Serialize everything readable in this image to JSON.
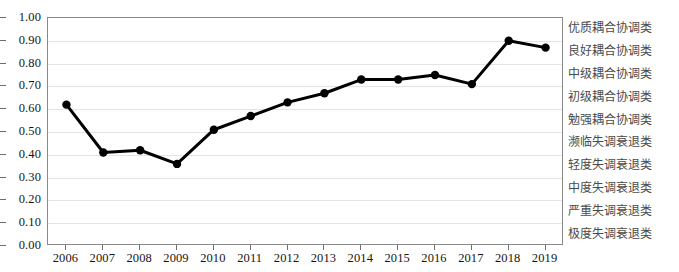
{
  "chart_data": {
    "type": "line",
    "title": "",
    "xlabel": "",
    "ylabel": "",
    "categories": [
      "2006",
      "2007",
      "2008",
      "2009",
      "2010",
      "2011",
      "2012",
      "2013",
      "2014",
      "2015",
      "2016",
      "2017",
      "2018",
      "2019"
    ],
    "values": [
      0.62,
      0.41,
      0.42,
      0.36,
      0.51,
      0.57,
      0.63,
      0.67,
      0.73,
      0.73,
      0.75,
      0.71,
      0.9,
      0.87
    ],
    "series": [
      {
        "name": "",
        "values": [
          0.62,
          0.41,
          0.42,
          0.36,
          0.51,
          0.57,
          0.63,
          0.67,
          0.73,
          0.73,
          0.75,
          0.71,
          0.9,
          0.87
        ]
      }
    ],
    "ylim": [
      0.0,
      1.0
    ],
    "ytick_values": [
      0.0,
      0.1,
      0.2,
      0.3,
      0.4,
      0.5,
      0.6,
      0.7,
      0.8,
      0.9,
      1.0
    ],
    "ytick_labels": [
      "0.00",
      "0.10",
      "0.20",
      "0.30",
      "0.40",
      "0.50",
      "0.60",
      "0.70",
      "0.80",
      "0.90",
      "1.00"
    ],
    "grid": true,
    "legend_position": "none",
    "marker": "circle",
    "line_color": "#000000",
    "marker_color": "#000000",
    "grid_color": "#e4e4e4",
    "axis_color": "#8a8a8a"
  },
  "y_axis": {
    "ticks": [
      {
        "label": "1.00",
        "value": 1.0
      },
      {
        "label": "0.90",
        "value": 0.9
      },
      {
        "label": "0.80",
        "value": 0.8
      },
      {
        "label": "0.70",
        "value": 0.7
      },
      {
        "label": "0.60",
        "value": 0.6
      },
      {
        "label": "0.50",
        "value": 0.5
      },
      {
        "label": "0.40",
        "value": 0.4
      },
      {
        "label": "0.30",
        "value": 0.3
      },
      {
        "label": "0.20",
        "value": 0.2
      },
      {
        "label": "0.10",
        "value": 0.1
      },
      {
        "label": "0.00",
        "value": 0.0
      }
    ]
  },
  "x_axis": {
    "ticks": [
      {
        "label": "2006"
      },
      {
        "label": "2007"
      },
      {
        "label": "2008"
      },
      {
        "label": "2009"
      },
      {
        "label": "2010"
      },
      {
        "label": "2011"
      },
      {
        "label": "2012"
      },
      {
        "label": "2013"
      },
      {
        "label": "2014"
      },
      {
        "label": "2015"
      },
      {
        "label": "2016"
      },
      {
        "label": "2017"
      },
      {
        "label": "2018"
      },
      {
        "label": "2019"
      }
    ]
  },
  "category_bands": {
    "items": [
      {
        "label": "优质耦合协调类",
        "upper": 1.0,
        "lower": 0.9
      },
      {
        "label": "良好耦合协调类",
        "upper": 0.9,
        "lower": 0.8
      },
      {
        "label": "中级耦合协调类",
        "upper": 0.8,
        "lower": 0.7
      },
      {
        "label": "初级耦合协调类",
        "upper": 0.7,
        "lower": 0.6
      },
      {
        "label": "勉强耦合协调类",
        "upper": 0.6,
        "lower": 0.5
      },
      {
        "label": "濒临失调衰退类",
        "upper": 0.5,
        "lower": 0.4
      },
      {
        "label": "轻度失调衰退类",
        "upper": 0.4,
        "lower": 0.3
      },
      {
        "label": "中度失调衰退类",
        "upper": 0.3,
        "lower": 0.2
      },
      {
        "label": "严重失调衰退类",
        "upper": 0.2,
        "lower": 0.1
      },
      {
        "label": "极度失调衰退类",
        "upper": 0.1,
        "lower": 0.0
      }
    ]
  }
}
